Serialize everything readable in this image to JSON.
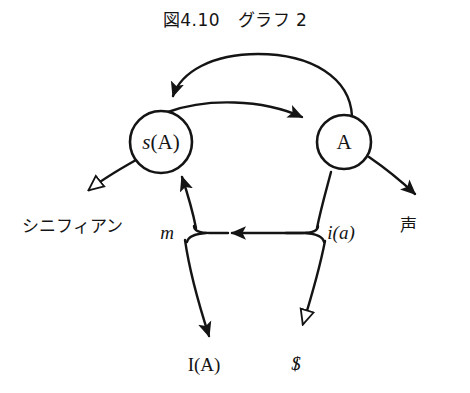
{
  "figure": {
    "title": "図4.10　グラフ 2",
    "caption_number": "4.10",
    "caption_name": "グラフ 2"
  },
  "diagram": {
    "type": "lacan-graph-of-desire",
    "stroke_color": "#141414",
    "background_color": "#ffffff",
    "nodes": [
      {
        "id": "sA",
        "label_prefix": "s",
        "label_suffix": "(A)",
        "label": "s(A)",
        "cx": 161,
        "cy": 142,
        "r": 31
      },
      {
        "id": "A",
        "label_prefix": "",
        "label_suffix": "A",
        "label": "A",
        "cx": 344,
        "cy": 142,
        "r": 27
      }
    ],
    "edge_labels": [
      {
        "id": "signifiant",
        "text": "シニフィアン",
        "x": 72,
        "y": 224,
        "style": "jp"
      },
      {
        "id": "m",
        "text": "m",
        "x": 167,
        "y": 233,
        "style": "italic"
      },
      {
        "id": "i-of-a",
        "text": "i(a)",
        "x": 341,
        "y": 233,
        "style": "italic"
      },
      {
        "id": "voice",
        "text": "声",
        "x": 408,
        "y": 223,
        "style": "jp"
      },
      {
        "id": "I-of-A",
        "text": "I(A)",
        "x": 204,
        "y": 365,
        "style": "roman"
      },
      {
        "id": "barred-subject",
        "text": "$",
        "x": 296,
        "y": 364,
        "style": "barred"
      }
    ],
    "arrowheads": [
      {
        "id": "arrow-into-sA-top",
        "fill": "solid",
        "target": "sA"
      },
      {
        "id": "arrow-into-A-left",
        "fill": "solid",
        "target": "A"
      },
      {
        "id": "arrow-into-sA-bottom",
        "fill": "solid",
        "target": "sA"
      },
      {
        "id": "arrow-inner-leftward",
        "fill": "solid",
        "target": "m-junction"
      },
      {
        "id": "arrow-to-I-of-A",
        "fill": "solid",
        "target": "I(A)"
      },
      {
        "id": "arrow-to-voice",
        "fill": "solid",
        "target": "声"
      },
      {
        "id": "arrow-tail-signifiant",
        "fill": "hollow",
        "target": "シニフィアン"
      },
      {
        "id": "arrow-tail-barred-subject",
        "fill": "hollow",
        "target": "$"
      }
    ]
  }
}
